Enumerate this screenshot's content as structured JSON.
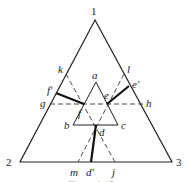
{
  "diagram": {
    "type": "ternary-phase-diagram",
    "vertices": [
      {
        "id": "1",
        "label": "1",
        "x": 95,
        "y": 20
      },
      {
        "id": "2",
        "label": "2",
        "x": 20,
        "y": 162
      },
      {
        "id": "3",
        "label": "3",
        "x": 172,
        "y": 162
      }
    ],
    "inner_triangle": [
      {
        "id": "a",
        "label": "a",
        "x": 96,
        "y": 82
      },
      {
        "id": "b",
        "label": "b",
        "x": 73,
        "y": 125
      },
      {
        "id": "c",
        "label": "c",
        "x": 118,
        "y": 125
      }
    ],
    "points": {
      "d": {
        "label": "d",
        "x": 96,
        "y": 125
      },
      "d_prime": {
        "label": "d'",
        "x": 91,
        "y": 162
      },
      "e": {
        "label": "e",
        "x": 107,
        "y": 104
      },
      "e_prime": {
        "label": "e'",
        "x": 129,
        "y": 86
      },
      "f": {
        "label": "f",
        "x": 84,
        "y": 104
      },
      "f_prime": {
        "label": "f'",
        "x": 56,
        "y": 93
      },
      "g": {
        "label": "g",
        "x": 50,
        "y": 104
      },
      "h": {
        "label": "h",
        "x": 143,
        "y": 104
      },
      "k": {
        "label": "k",
        "x": 66,
        "y": 74
      },
      "l": {
        "label": "l",
        "x": 124,
        "y": 74
      },
      "m": {
        "label": "m",
        "x": 78,
        "y": 162
      },
      "j": {
        "label": "j",
        "x": 115,
        "y": 162
      }
    },
    "caption": "Figure 1.15"
  }
}
